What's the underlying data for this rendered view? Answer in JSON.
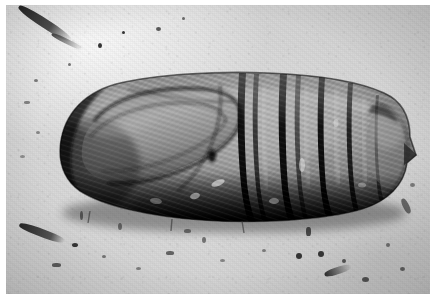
{
  "image": {
    "kind": "photograph",
    "medium": "black-and-white halftone photographic plate",
    "subject": "insect pupa (chrysalis), lateral view",
    "orientation": "horizontal, head at left, cremaster tip at right",
    "caption": "",
    "border": {
      "present": true,
      "color": "#ffffff",
      "thickness_px": 6
    },
    "canvas": {
      "width": 437,
      "height": 300
    }
  },
  "palette": {
    "page_background": "#ffffff",
    "substrate_light": "#dedbd6",
    "substrate_mid": "#d4d1cb",
    "substrate_dark": "#c9c6c0",
    "specimen_highlight": "#b5b1aa",
    "specimen_midtone": "#8a857e",
    "specimen_shadow": "#4a4641",
    "specimen_deep_shadow": "#211f1d",
    "outline": "#141312",
    "debris": "#3b3936"
  },
  "specimen": {
    "label": "pupa-body",
    "bounding_box": {
      "x": 52,
      "y": 72,
      "width": 358,
      "height": 145
    },
    "head_tip": {
      "x": 54,
      "y": 148
    },
    "tail_tip": {
      "x": 410,
      "y": 150
    },
    "regions": [
      {
        "name": "head-and-thorax",
        "x_start": 52,
        "x_end": 150,
        "description": "rounded anterior dome, darkest at lower left margin"
      },
      {
        "name": "wing-case",
        "x_start": 80,
        "x_end": 235,
        "description": "large teardrop wing case with curved suture outline sweeping from upper right down to lower left"
      },
      {
        "name": "abdomen",
        "x_start": 235,
        "x_end": 375,
        "description": "transversely segmented abdomen with deep dark intersegmental grooves"
      },
      {
        "name": "cremaster",
        "x_start": 375,
        "x_end": 410,
        "description": "rounded terminal segment ending in a short pointed spine"
      }
    ],
    "segment_grooves_x": [
      233,
      248,
      274,
      288,
      312,
      341,
      370
    ],
    "spiracle": {
      "x": 206,
      "y": 151,
      "rx": 4,
      "ry": 6,
      "description": "small dark oval spiracle on mid abdomen"
    },
    "shadow": {
      "description": "heavy cast shadow along the entire ventral (lower) margin of the body",
      "y_start": 182,
      "y_end": 218
    }
  },
  "background_features": [
    {
      "name": "twig-fragment",
      "x": 10,
      "y": 12,
      "width": 58,
      "height": 30,
      "angle_deg": 32,
      "description": "dark diagonal twig or fibre at upper left"
    },
    {
      "name": "debris-cluster-left",
      "x": 16,
      "y": 218,
      "width": 52,
      "height": 24,
      "angle_deg": 22,
      "description": "elongated dark debris fragment lower left"
    },
    {
      "name": "debris-cluster-bottom-right",
      "x": 300,
      "y": 235,
      "width": 110,
      "height": 55,
      "description": "scattered dark specks and small fragments lower right"
    },
    {
      "name": "speck-field",
      "description": "granular dust and small dark particles scattered across the pale substrate"
    }
  ],
  "annotations": {
    "text_labels": [],
    "scale_bar": null,
    "arrows": []
  }
}
